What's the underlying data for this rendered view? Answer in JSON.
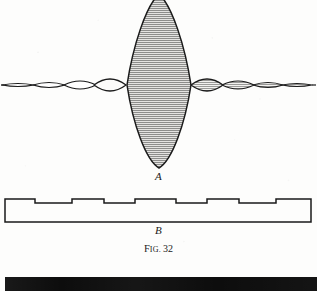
{
  "figure": {
    "caption_prefix": "F",
    "caption_smallcaps": "IG.",
    "caption_number": "32",
    "caption_full": "FIG. 32",
    "panel_a_label": "A",
    "panel_b_label": "B",
    "background_color": "#fdfdfc",
    "ink_color": "#1a1a1a",
    "shading_color": "#8a8a8a"
  },
  "chart_data": {
    "type": "line",
    "subtitle": "Diffraction amplitude distribution (A) and corresponding stepped phase plate profile (B)",
    "xlabel": "",
    "ylabel": "",
    "grid": false,
    "legend": null,
    "panels": [
      {
        "id": "A",
        "label": "A",
        "description": "Symmetric lens-shaped (spindle) lobes along a horizontal axis: one very large hatched central lobe flanked by progressively smaller side lobes; right-hand lobes are shaded with horizontal hatching.",
        "baseline_y": 85,
        "axis_x_range": [
          2,
          315
        ],
        "lobes": [
          {
            "index": -4,
            "center_x": 18,
            "half_width": 16,
            "half_height": 3,
            "shaded": false
          },
          {
            "index": -3,
            "center_x": 49,
            "half_width": 16,
            "half_height": 5,
            "shaded": false
          },
          {
            "index": -2,
            "center_x": 80,
            "half_width": 16,
            "half_height": 8,
            "shaded": false
          },
          {
            "index": -1,
            "center_x": 110,
            "half_width": 16,
            "half_height": 12,
            "shaded": false
          },
          {
            "index": 0,
            "center_x": 159,
            "half_width": 32,
            "half_height": 86,
            "shaded": true
          },
          {
            "index": 1,
            "center_x": 207,
            "half_width": 16,
            "half_height": 12,
            "shaded": true
          },
          {
            "index": 2,
            "center_x": 238,
            "half_width": 16,
            "half_height": 8,
            "shaded": true
          },
          {
            "index": 3,
            "center_x": 268,
            "half_width": 15,
            "half_height": 5,
            "shaded": true
          },
          {
            "index": 4,
            "center_x": 297,
            "half_width": 15,
            "half_height": 3,
            "shaded": true
          }
        ]
      },
      {
        "id": "B",
        "label": "B",
        "description": "Rectangular plate in cross-section whose upper surface is a symmetric staircase: thin outer ends, stepping down twice toward the centre and back up.",
        "rect": {
          "left": 5,
          "right": 311,
          "bottom_y": 222
        },
        "step_profile_y": [
          199,
          203,
          199,
          203,
          199,
          203,
          199,
          203,
          199
        ],
        "step_edges_x": [
          5,
          35,
          72,
          104,
          135,
          176,
          207,
          239,
          276,
          311
        ],
        "step_count": 9
      }
    ]
  }
}
